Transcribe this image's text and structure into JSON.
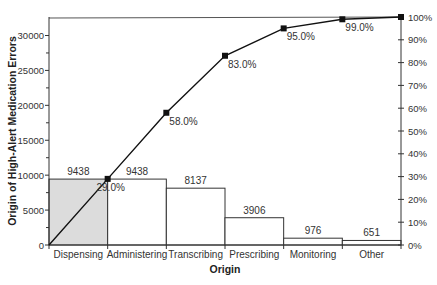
{
  "chart_data": {
    "type": "bar",
    "subtype": "pareto",
    "title": "",
    "xlabel": "Origin",
    "ylabel": "Origin of High-Alert Medication Errors",
    "y2label": "",
    "categories": [
      "Dispensing",
      "Administering",
      "Transcribing",
      "Prescribing",
      "Monitoring",
      "Other"
    ],
    "series": [
      {
        "name": "Errors",
        "type": "bar",
        "values": [
          9438,
          9438,
          8137,
          3906,
          976,
          651
        ]
      },
      {
        "name": "Cumulative %",
        "type": "line",
        "values": [
          29.0,
          58.0,
          83.0,
          95.0,
          99.0,
          100.0
        ]
      }
    ],
    "bar_labels": [
      "9438",
      "9438",
      "8137",
      "3906",
      "976",
      "651"
    ],
    "cumulative_labels": [
      "29.0%",
      "58.0%",
      "83.0%",
      "95.0%",
      "99.0%",
      ""
    ],
    "ylim": [
      0,
      32500
    ],
    "y_ticks": [
      0,
      5000,
      10000,
      15000,
      20000,
      25000,
      30000
    ],
    "y2lim": [
      0,
      100
    ],
    "y2_ticks": [
      "0%",
      "10%",
      "20%",
      "30%",
      "40%",
      "50%",
      "60%",
      "70%",
      "80%",
      "90%",
      "100%"
    ],
    "grid": false,
    "legend": "none",
    "highlight_bar_color": "#dcdcdc",
    "bar_color": "#ffffff",
    "line_color": "#111111"
  }
}
